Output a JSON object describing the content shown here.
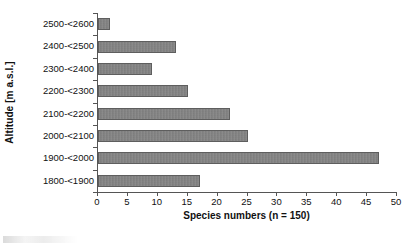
{
  "chart_data": {
    "type": "bar",
    "orientation": "horizontal",
    "title": "",
    "xlabel": "Species numbers (n = 150)",
    "ylabel": "Altitude [m a.s.l.]",
    "categories": [
      "2500-<2600",
      "2400-<2500",
      "2300-<2400",
      "2200-<2300",
      "2100-<2200",
      "2000-<2100",
      "1900-<2000",
      "1800-<1900"
    ],
    "values": [
      2,
      13,
      9,
      15,
      22,
      25,
      47,
      17
    ],
    "xlim": [
      0,
      50
    ],
    "xticks": [
      0,
      5,
      10,
      15,
      20,
      25,
      30,
      35,
      40,
      45,
      50
    ],
    "xtick_labels": [
      "0",
      "5",
      "10",
      "15",
      "20",
      "25",
      "30",
      "35",
      "40",
      "45",
      "50"
    ],
    "grid": false,
    "legend": false,
    "total_n": 150,
    "bar_color": "#848484",
    "bar_edge_color": "#5e5e5e",
    "axis_color": "#555555",
    "text_color": "#111111"
  }
}
